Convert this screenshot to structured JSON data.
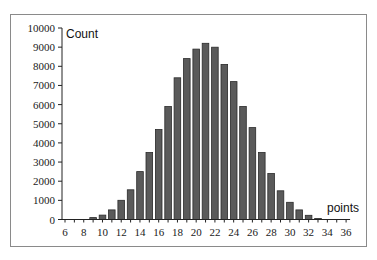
{
  "chart_data": {
    "type": "bar",
    "title": "",
    "xlabel": "points",
    "ylabel": "Count",
    "x": [
      6,
      7,
      8,
      9,
      10,
      11,
      12,
      13,
      14,
      15,
      16,
      17,
      18,
      19,
      20,
      21,
      22,
      23,
      24,
      25,
      26,
      27,
      28,
      29,
      30,
      31,
      32,
      33,
      34,
      35,
      36
    ],
    "values": [
      0,
      0,
      0,
      100,
      230,
      500,
      1000,
      1550,
      2500,
      3500,
      4700,
      5900,
      7400,
      8400,
      8900,
      9200,
      9000,
      8100,
      7200,
      5900,
      4800,
      3500,
      2400,
      1500,
      900,
      500,
      220,
      60,
      0,
      0,
      0
    ],
    "xlim": [
      6,
      36
    ],
    "ylim": [
      0,
      10000
    ],
    "x_ticks": [
      "6",
      "8",
      "10",
      "12",
      "14",
      "16",
      "18",
      "20",
      "22",
      "24",
      "26",
      "28",
      "30",
      "32",
      "34",
      "36"
    ],
    "y_ticks": [
      "0",
      "1000",
      "2000",
      "3000",
      "4000",
      "5000",
      "6000",
      "7000",
      "8000",
      "9000",
      "10000"
    ],
    "grid": false,
    "legend": null,
    "bar_color": "#5a5a5a"
  }
}
